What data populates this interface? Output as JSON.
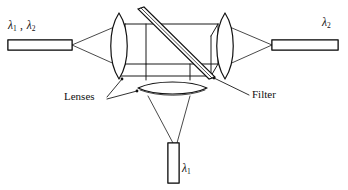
{
  "figure": {
    "type": "optical-diagram",
    "title_visible": false,
    "background_color": "#ffffff",
    "line_color": "#111111",
    "width": 348,
    "height": 190
  },
  "labels": {
    "input_fiber": {
      "text": "λ1 , λ2",
      "lambda_one": "λ",
      "sub_one": "1",
      "separator": " , ",
      "lambda_two": "λ",
      "sub_two": "2",
      "x": 8,
      "y": 26
    },
    "output_right_fiber": {
      "text": "λ2",
      "lambda": "λ",
      "sub": "2",
      "x": 322,
      "y": 22
    },
    "output_bottom_fiber": {
      "text": "λ1",
      "lambda": "λ",
      "sub": "1",
      "x": 181,
      "y": 166
    },
    "lenses": {
      "text": "Lenses",
      "x": 68,
      "y": 93
    },
    "filter": {
      "text": "Filter",
      "x": 252,
      "y": 92
    }
  },
  "components": [
    {
      "name": "input-fiber",
      "kind": "hatched-bar",
      "orientation": "horizontal",
      "carries": "λ1 , λ2"
    },
    {
      "name": "collimating-lens-left",
      "kind": "biconvex-lens",
      "orientation": "vertical"
    },
    {
      "name": "interference-filter",
      "kind": "tilted-plate",
      "angle_deg": 45
    },
    {
      "name": "collimating-lens-right",
      "kind": "biconvex-lens",
      "orientation": "vertical"
    },
    {
      "name": "focusing-lens-bottom",
      "kind": "biconvex-lens",
      "orientation": "perspective-ellipse"
    },
    {
      "name": "output-fiber-right",
      "kind": "hatched-bar",
      "orientation": "horizontal",
      "carries": "λ2"
    },
    {
      "name": "output-fiber-bottom",
      "kind": "hatched-bar",
      "orientation": "vertical",
      "carries": "λ1"
    },
    {
      "name": "housing-box",
      "kind": "wireframe-box"
    }
  ]
}
